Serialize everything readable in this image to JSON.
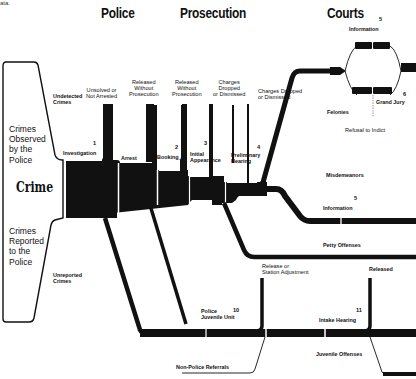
{
  "corner_text": "ata.",
  "headers": {
    "police": "Police",
    "prosecution": "Prosecution",
    "courts": "Courts"
  },
  "entry": {
    "observed": "Crimes Observed by the Police",
    "observed_lines": [
      "Crimes",
      "Observed",
      "by the",
      "Police"
    ],
    "crime": "Crime",
    "reported_lines": [
      "Crimes",
      "Reported",
      "to the",
      "Police"
    ]
  },
  "side_labels": {
    "undetected": [
      "Undetected",
      "Crimes"
    ],
    "unreported": [
      "Unreported",
      "Crimes"
    ]
  },
  "stages": [
    {
      "num": "1",
      "label": [
        "Investigation"
      ]
    },
    {
      "num": "",
      "label": [
        "Arrest"
      ]
    },
    {
      "num": "2",
      "label": [
        "Booking"
      ]
    },
    {
      "num": "3",
      "label": [
        "Initial",
        "Appearance"
      ]
    },
    {
      "num": "4",
      "label": [
        "Preliminary",
        "Hearing"
      ]
    }
  ],
  "exits": [
    {
      "label": [
        "Unsolved or",
        "Not Arrested"
      ]
    },
    {
      "label": [
        "Released",
        "Without",
        "Prosecution"
      ]
    },
    {
      "label": [
        "Released",
        "Without",
        "Prosecution"
      ]
    },
    {
      "label": [
        "Charges",
        "Dropped",
        "or Dismissed"
      ]
    },
    {
      "label": [
        "Charges Dropped",
        "or Dismissed"
      ]
    }
  ],
  "courts": {
    "information_top": {
      "num": "5",
      "label": "Information"
    },
    "grand_jury": {
      "num": "6",
      "label": "Grand Jury"
    },
    "refusal": "Refusal to Indict",
    "felonies": "Felonies",
    "misdemeanors": "Misdemeanors",
    "information_mid": {
      "num": "5",
      "label": "Information"
    },
    "petty": "Petty Offenses"
  },
  "juvenile": {
    "police_unit": {
      "num": "10",
      "label": [
        "Police",
        "Juvenile Unit"
      ]
    },
    "release_adjust": [
      "Release or",
      "Station Adjustment"
    ],
    "intake": {
      "num": "11",
      "label": "Intake Hearing"
    },
    "released": "Released",
    "non_police": "Non-Police Referrals",
    "offenses": "Juvenile Offenses"
  },
  "colors": {
    "ink": "#111111",
    "paper": "#ffffff"
  }
}
